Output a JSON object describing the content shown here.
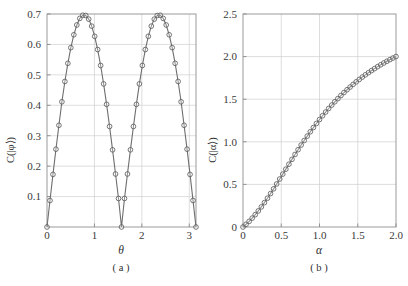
{
  "figure": {
    "panels": [
      {
        "caption": "( a )",
        "xlabel": "θ",
        "ylabel": "C(|φ⟩)",
        "xticks": [
          "0",
          "1",
          "2",
          "3"
        ],
        "yticks": [
          "0.1",
          "0.2",
          "0.3",
          "0.4",
          "0.5",
          "0.6",
          "0.7"
        ]
      },
      {
        "caption": "( b )",
        "xlabel": "α",
        "ylabel": "C(|α⟩)",
        "xticks": [
          "0",
          "0.5",
          "1.0",
          "1.5",
          "2.0"
        ],
        "yticks": [
          "0",
          "0.5",
          "1.0",
          "1.5",
          "2.0",
          "2.5"
        ]
      }
    ]
  },
  "colors": {
    "frame": "#9a9a9a",
    "grid": "#cfcfcf",
    "curve": "#6e6e6e",
    "marker_stroke": "#5d5d5d",
    "text": "#2e2e2e",
    "background": "#ffffff"
  },
  "chart_data": [
    {
      "type": "line",
      "title": "",
      "caption": "( a )",
      "xlabel": "θ",
      "ylabel": "C(|φ⟩)",
      "xlim": [
        0,
        3.1416
      ],
      "ylim": [
        0,
        0.7
      ],
      "xticks": [
        0,
        1,
        2,
        3
      ],
      "xticklabels": [
        "0",
        "1",
        "2",
        "3"
      ],
      "yticks": [
        0.1,
        0.2,
        0.3,
        0.4,
        0.5,
        0.6,
        0.7
      ],
      "yticklabels": [
        "0.1",
        "0.2",
        "0.3",
        "0.4",
        "0.5",
        "0.6",
        "0.7"
      ],
      "grid": true,
      "legend": null,
      "marker": "open-circle",
      "description": "Concurrence C(|phi>) oscillates as |sin(2*theta)| with two maxima of about 0.695 at theta = pi/4 and 3pi/4, and zeros at theta = 0, pi/2 and pi.",
      "x": [
        0.0,
        0.0628,
        0.1257,
        0.1885,
        0.2513,
        0.3142,
        0.377,
        0.4398,
        0.5027,
        0.5655,
        0.6283,
        0.6912,
        0.754,
        0.8168,
        0.8796,
        0.9425,
        1.0053,
        1.0681,
        1.131,
        1.1938,
        1.2566,
        1.3195,
        1.3823,
        1.4451,
        1.508,
        1.5708,
        1.6336,
        1.6965,
        1.7593,
        1.8221,
        1.885,
        1.9478,
        2.0106,
        2.0735,
        2.1363,
        2.1991,
        2.2619,
        2.3248,
        2.3876,
        2.4504,
        2.5133,
        2.5761,
        2.6389,
        2.7018,
        2.7646,
        2.8274,
        2.8903,
        2.9531,
        3.0159,
        3.0788,
        3.1416
      ],
      "y": [
        0.0,
        0.0871,
        0.1728,
        0.2557,
        0.3343,
        0.4115,
        0.4782,
        0.5379,
        0.5894,
        0.6317,
        0.6639,
        0.6855,
        0.6959,
        0.6951,
        0.6831,
        0.6601,
        0.6266,
        0.5832,
        0.5308,
        0.4703,
        0.4031,
        0.3304,
        0.2536,
        0.1742,
        0.0938,
        0.0,
        0.0938,
        0.1742,
        0.2536,
        0.3304,
        0.4031,
        0.4703,
        0.5308,
        0.5832,
        0.6266,
        0.6601,
        0.6831,
        0.6951,
        0.6959,
        0.6855,
        0.6639,
        0.6317,
        0.5894,
        0.5379,
        0.4782,
        0.4115,
        0.3343,
        0.2557,
        0.1728,
        0.0871,
        0.0
      ]
    },
    {
      "type": "line",
      "title": "",
      "caption": "( b )",
      "xlabel": "α",
      "ylabel": "C(|α⟩)",
      "xlim": [
        0,
        2.0
      ],
      "ylim": [
        0,
        2.5
      ],
      "xticks": [
        0,
        0.5,
        1.0,
        1.5,
        2.0
      ],
      "xticklabels": [
        "0",
        "0.5",
        "1.0",
        "1.5",
        "2.0"
      ],
      "yticks": [
        0,
        0.5,
        1.0,
        1.5,
        2.0,
        2.5
      ],
      "yticklabels": [
        "0",
        "0.5",
        "1.0",
        "1.5",
        "2.0",
        "2.5"
      ],
      "grid": true,
      "legend": null,
      "marker": "open-circle",
      "description": "Concurrence C(|alpha>) rises monotonically and concavely from 0 at alpha = 0 to about 2.07 at alpha = 2.0.",
      "x": [
        0.0,
        0.04,
        0.08,
        0.12,
        0.16,
        0.2,
        0.24,
        0.28,
        0.32,
        0.36,
        0.4,
        0.44,
        0.48,
        0.52,
        0.56,
        0.6,
        0.64,
        0.68,
        0.72,
        0.76,
        0.8,
        0.84,
        0.88,
        0.92,
        0.96,
        1.0,
        1.04,
        1.08,
        1.12,
        1.16,
        1.2,
        1.24,
        1.28,
        1.32,
        1.36,
        1.4,
        1.44,
        1.48,
        1.52,
        1.56,
        1.6,
        1.64,
        1.68,
        1.72,
        1.76,
        1.8,
        1.84,
        1.88,
        1.92,
        1.96,
        2.0
      ],
      "y": [
        0.0,
        0.032,
        0.066,
        0.104,
        0.145,
        0.189,
        0.236,
        0.286,
        0.338,
        0.392,
        0.448,
        0.505,
        0.563,
        0.621,
        0.679,
        0.737,
        0.794,
        0.851,
        0.907,
        0.962,
        1.015,
        1.067,
        1.118,
        1.167,
        1.215,
        1.261,
        1.306,
        1.349,
        1.391,
        1.431,
        1.47,
        1.507,
        1.543,
        1.578,
        1.611,
        1.643,
        1.674,
        1.704,
        1.732,
        1.76,
        1.786,
        1.811,
        1.836,
        1.859,
        1.882,
        1.904,
        1.925,
        1.945,
        1.964,
        1.983,
        2.001
      ]
    }
  ]
}
